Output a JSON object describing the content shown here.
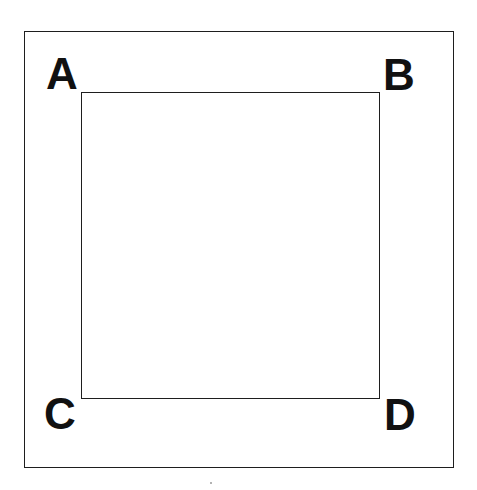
{
  "diagram": {
    "type": "nested-squares",
    "outer_square": {
      "label": "outer square",
      "stroke_color": "#1e1e1e"
    },
    "inner_square": {
      "label": "inner square",
      "stroke_color": "#1e1e1e"
    },
    "corner_labels": [
      {
        "id": "A",
        "text": "A",
        "position": "top-left"
      },
      {
        "id": "B",
        "text": "B",
        "position": "top-right"
      },
      {
        "id": "C",
        "text": "C",
        "position": "bottom-left"
      },
      {
        "id": "D",
        "text": "D",
        "position": "bottom-right"
      }
    ]
  }
}
